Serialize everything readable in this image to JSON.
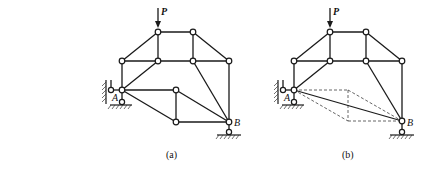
{
  "figures": [
    {
      "id": "a",
      "caption": "(a)",
      "load_label": "P",
      "support_labels": {
        "left": "A",
        "right": "B"
      },
      "nodes": [
        [
          158,
          32
        ],
        [
          193,
          32
        ],
        [
          122,
          61
        ],
        [
          158,
          61
        ],
        [
          193,
          61
        ],
        [
          229,
          61
        ],
        [
          122,
          90
        ],
        [
          176,
          90
        ],
        [
          176,
          122
        ],
        [
          229,
          122
        ]
      ],
      "members": [
        [
          0,
          1
        ],
        [
          0,
          2
        ],
        [
          0,
          3
        ],
        [
          1,
          4
        ],
        [
          1,
          5
        ],
        [
          2,
          3
        ],
        [
          3,
          4
        ],
        [
          4,
          5
        ],
        [
          2,
          6
        ],
        [
          3,
          6
        ],
        [
          4,
          9
        ],
        [
          5,
          9
        ],
        [
          6,
          7
        ],
        [
          6,
          8
        ],
        [
          7,
          8
        ],
        [
          7,
          9
        ],
        [
          8,
          9
        ]
      ]
    },
    {
      "id": "b",
      "caption": "(b)",
      "load_label": "P",
      "support_labels": {
        "left": "A",
        "right": "B"
      },
      "nodes": [
        [
          330,
          32
        ],
        [
          366,
          32
        ],
        [
          294,
          61
        ],
        [
          330,
          61
        ],
        [
          366,
          61
        ],
        [
          402,
          61
        ],
        [
          294,
          90
        ],
        [
          402,
          121
        ]
      ],
      "members": [
        [
          0,
          1
        ],
        [
          0,
          2
        ],
        [
          0,
          3
        ],
        [
          1,
          4
        ],
        [
          1,
          5
        ],
        [
          2,
          3
        ],
        [
          3,
          4
        ],
        [
          4,
          5
        ],
        [
          2,
          6
        ],
        [
          3,
          6
        ],
        [
          4,
          7
        ],
        [
          5,
          7
        ],
        [
          6,
          7
        ]
      ],
      "dashed_replaced": [
        [
          294,
          90
        ],
        [
          348,
          90
        ],
        [
          402,
          121
        ],
        [
          348,
          121
        ]
      ]
    }
  ],
  "colors": {
    "line": "#1a1a1a",
    "dashed": "#555555",
    "background": "#ffffff"
  }
}
